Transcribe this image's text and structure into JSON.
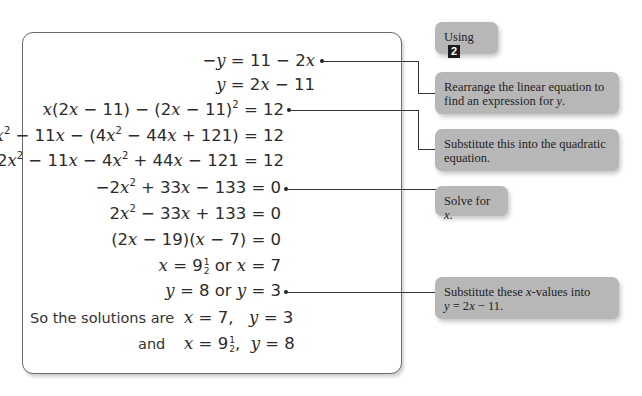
{
  "solution_box": {
    "lines": [
      {
        "id": "l1",
        "text": "−y = 11 − 2x",
        "callout": "rearrange"
      },
      {
        "id": "l2",
        "text": "y = 2x − 11"
      },
      {
        "id": "l3",
        "text": "x(2x − 11) − (2x − 11)² = 12",
        "callout": "substitute_quadratic"
      },
      {
        "id": "l4",
        "text": "2x² − 11x − (4x² − 44x + 121) = 12"
      },
      {
        "id": "l5",
        "text": "2x² − 11x − 4x² + 44x − 121 = 12"
      },
      {
        "id": "l6",
        "text": "−2x² + 33x − 133 = 0",
        "callout": "solve"
      },
      {
        "id": "l7",
        "text": "2x² − 33x + 133 = 0"
      },
      {
        "id": "l8",
        "text": "(2x − 19)(x − 7) = 0"
      },
      {
        "id": "l9",
        "text": "x = 9½ or x = 7"
      },
      {
        "id": "l10",
        "text": "y = 8 or y = 3",
        "callout": "substitute_x_values"
      },
      {
        "id": "l11",
        "label": "So the solutions are",
        "text": "x = 7,   y = 3"
      },
      {
        "id": "l12",
        "label": "and",
        "text": "x = 9½,  y = 8"
      }
    ]
  },
  "callouts": {
    "using": {
      "text": "Using",
      "badge": "2"
    },
    "rearrange": {
      "text": "Rearrange the linear equation to find an expression for y."
    },
    "substitute_quadratic": {
      "text": "Substitute this into the quadratic equation."
    },
    "solve": {
      "text": "Solve for x."
    },
    "substitute_x_values": {
      "text": "Substitute these x-values into y = 2x − 11."
    }
  },
  "colors": {
    "callout_bg": "#b7b7b7",
    "badge_bg": "#1a1a1a",
    "border": "#6a6a6a"
  }
}
